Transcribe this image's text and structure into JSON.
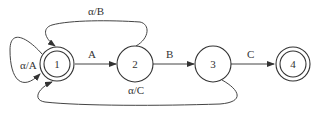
{
  "diagram": {
    "type": "state-machine",
    "nodes": [
      {
        "id": "1",
        "label": "1",
        "accepting": true,
        "initial_self_loop": true
      },
      {
        "id": "2",
        "label": "2",
        "accepting": false
      },
      {
        "id": "3",
        "label": "3",
        "accepting": false
      },
      {
        "id": "4",
        "label": "4",
        "accepting": true
      }
    ],
    "edges": [
      {
        "from": "1",
        "to": "1",
        "label": "α/A"
      },
      {
        "from": "1",
        "to": "2",
        "label": "A"
      },
      {
        "from": "2",
        "to": "3",
        "label": "B"
      },
      {
        "from": "3",
        "to": "4",
        "label": "C"
      },
      {
        "from": "2",
        "to": "1",
        "label": "α/B"
      },
      {
        "from": "3",
        "to": "1",
        "label": "α/C"
      }
    ]
  }
}
